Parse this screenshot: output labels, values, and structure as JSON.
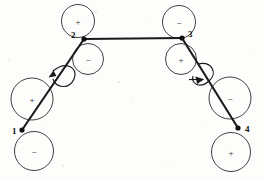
{
  "figure": {
    "type": "structural-frame-diagram",
    "background_color": "#fdfdfb",
    "line_color": "#1a1a1a",
    "stroke_color": "#2b2b2b"
  },
  "nodes": [
    {
      "id": "node-1",
      "label": "1",
      "x": 22,
      "y": 130,
      "label_x": 14,
      "label_y": 133
    },
    {
      "id": "node-2",
      "label": "2",
      "x": 84,
      "y": 39,
      "label_x": 72,
      "label_y": 38
    },
    {
      "id": "node-3",
      "label": "3",
      "x": 182,
      "y": 38,
      "label_x": 189,
      "label_y": 37
    },
    {
      "id": "node-4",
      "label": "4",
      "x": 238,
      "y": 128,
      "label_x": 246,
      "label_y": 131
    }
  ],
  "members": [
    {
      "id": "member-1-2",
      "from": "node-1",
      "to": "node-2",
      "x1": 22,
      "y1": 130,
      "x2": 84,
      "y2": 39
    },
    {
      "id": "member-2-3",
      "from": "node-2",
      "to": "node-3",
      "x1": 84,
      "y1": 39,
      "x2": 182,
      "y2": 38
    },
    {
      "id": "member-3-4",
      "from": "node-3",
      "to": "node-4",
      "x1": 182,
      "y1": 38,
      "x2": 238,
      "y2": 128
    }
  ],
  "sign_circles": [
    {
      "id": "circle-top-left",
      "sign": "+",
      "cx": 78,
      "cy": 21,
      "r": 16.5
    },
    {
      "id": "circle-below-2",
      "sign": "−",
      "cx": 88,
      "cy": 59,
      "r": 15.5
    },
    {
      "id": "circle-left-upper",
      "sign": "+",
      "cx": 32,
      "cy": 99,
      "r": 21.0
    },
    {
      "id": "circle-left-lower",
      "sign": "−",
      "cx": 34,
      "cy": 151,
      "r": 19.5
    },
    {
      "id": "circle-top-right",
      "sign": "−",
      "cx": 179,
      "cy": 22,
      "r": 16.5
    },
    {
      "id": "circle-below-3",
      "sign": "+",
      "cx": 181,
      "cy": 59,
      "r": 15.5
    },
    {
      "id": "circle-right-upper",
      "sign": "−",
      "cx": 230,
      "cy": 98,
      "r": 21.0
    },
    {
      "id": "circle-right-lower",
      "sign": "+",
      "cx": 231,
      "cy": 152,
      "r": 19.5
    }
  ],
  "moment_loops": [
    {
      "id": "loop-left",
      "direction": "counter-clockwise",
      "center_x": 62,
      "center_y": 76,
      "arrow_tip_x": 50,
      "arrow_tip_y": 72
    },
    {
      "id": "loop-right",
      "direction": "clockwise",
      "center_x": 201,
      "center_y": 74,
      "arrow_tip_x": 200,
      "arrow_tip_y": 84
    }
  ],
  "legend": {
    "plus_symbol": "+",
    "minus_symbol": "−"
  }
}
